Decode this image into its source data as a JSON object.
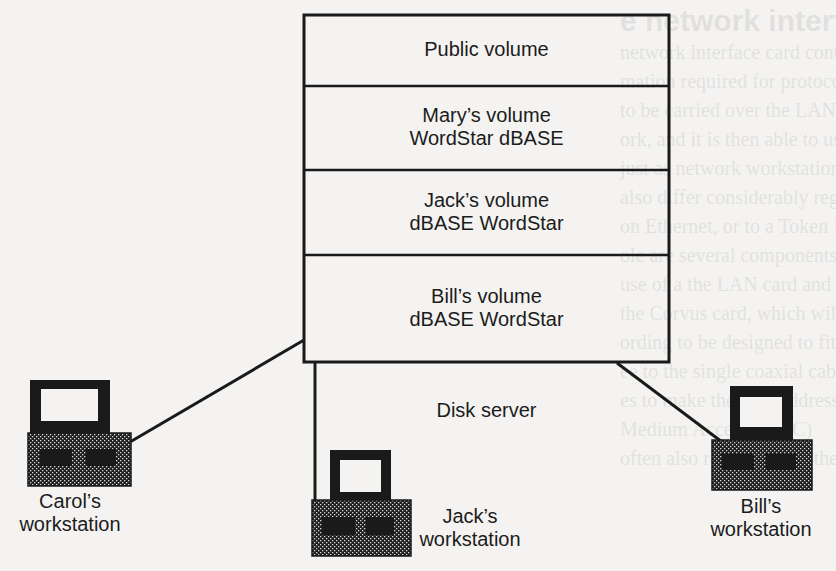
{
  "diagram": {
    "server": {
      "label": "Disk server",
      "volumes": [
        {
          "id": "public",
          "line1": "Public volume",
          "line2": ""
        },
        {
          "id": "mary",
          "line1": "Mary’s volume",
          "line2": "WordStar dBASE"
        },
        {
          "id": "jack",
          "line1": "Jack’s volume",
          "line2": "dBASE WordStar"
        },
        {
          "id": "bill",
          "line1": "Bill’s volume",
          "line2": "dBASE WordStar"
        }
      ]
    },
    "workstations": [
      {
        "id": "carol",
        "line1": "Carol’s",
        "line2": "workstation"
      },
      {
        "id": "jack",
        "line1": "Jack’s",
        "line2": "workstation"
      },
      {
        "id": "bill",
        "line1": "Bill’s",
        "line2": "workstation"
      }
    ],
    "connections": [
      {
        "from": "disk-server",
        "to": "carol-workstation"
      },
      {
        "from": "disk-server",
        "to": "jack-workstation"
      },
      {
        "from": "disk-server",
        "to": "bill-workstation"
      }
    ]
  },
  "bleed_through": {
    "heading": "e network interface card",
    "lines": [
      "network interface card contains the brains of a LAN",
      "mation required for protocols, routing, and formatting",
      "to be carried over the LAN cable during the transfer",
      "ork, and it is then able to use the information it receives",
      "just as network workstations do independently of the",
      "also differ considerably regarding the way it stores",
      "on Ethernet, or to a Token Ring card. A single",
      "ole are several components — the interface card and",
      "use of a the LAN card and the network software",
      "the Corvus card, which will serve as an example",
      "ording to be designed to fit into an IBM PC or",
      "ee to the single coaxial cable connection",
      "es to make the card address (when the interface",
      "Medium Access (MAC)",
      "often also referred to as the"
    ]
  }
}
